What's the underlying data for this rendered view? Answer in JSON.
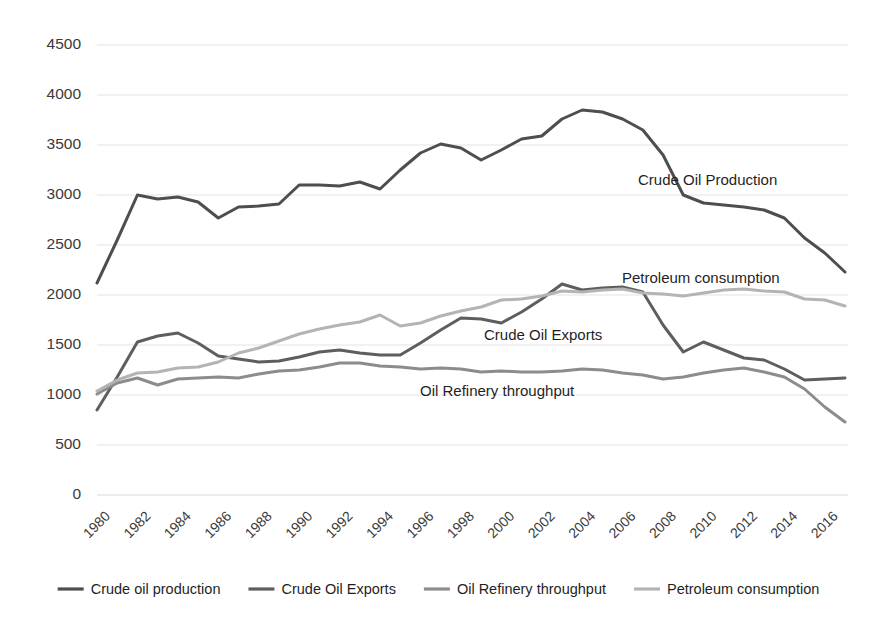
{
  "chart_data": {
    "type": "line",
    "title": "",
    "xlabel": "",
    "ylabel": "",
    "ylim": [
      0,
      4500
    ],
    "ytick_step": 500,
    "grid": true,
    "legend_position": "bottom",
    "x": [
      1980,
      1981,
      1982,
      1983,
      1984,
      1985,
      1986,
      1987,
      1988,
      1989,
      1990,
      1991,
      1992,
      1993,
      1994,
      1995,
      1996,
      1997,
      1998,
      1999,
      2000,
      2001,
      2002,
      2003,
      2004,
      2005,
      2006,
      2007,
      2008,
      2009,
      2010,
      2011,
      2012,
      2013,
      2014,
      2015,
      2016,
      2017
    ],
    "xtick_labels": [
      "1980",
      "1982",
      "1984",
      "1986",
      "1988",
      "1990",
      "1992",
      "1994",
      "1996",
      "1998",
      "2000",
      "2002",
      "2004",
      "2006",
      "2008",
      "2010",
      "2012",
      "2014",
      "2016"
    ],
    "ytick_labels": [
      "0",
      "500",
      "1000",
      "1500",
      "2000",
      "2500",
      "3000",
      "3500",
      "4000",
      "4500"
    ],
    "series": [
      {
        "name": "Crude oil production",
        "color": "#4e4e4e",
        "width": 3.0,
        "annotation": "Crude Oil Production",
        "values": [
          2120,
          2550,
          3000,
          2960,
          2980,
          2930,
          2770,
          2880,
          2890,
          2910,
          3100,
          3100,
          3090,
          3130,
          3060,
          3250,
          3420,
          3510,
          3470,
          3350,
          3450,
          3560,
          3590,
          3760,
          3850,
          3830,
          3760,
          3650,
          3400,
          3000,
          2920,
          2900,
          2880,
          2850,
          2770,
          2570,
          2420,
          2230
        ]
      },
      {
        "name": "Crude Oil Exports",
        "color": "#5e5e5e",
        "width": 3.0,
        "annotation": "Crude Oil Exports",
        "values": [
          850,
          1180,
          1530,
          1590,
          1620,
          1520,
          1390,
          1360,
          1330,
          1340,
          1380,
          1430,
          1450,
          1420,
          1400,
          1400,
          1520,
          1650,
          1770,
          1760,
          1720,
          1830,
          1960,
          2110,
          2050,
          2070,
          2080,
          2030,
          1700,
          1430,
          1530,
          1450,
          1370,
          1350,
          1260,
          1150,
          1160,
          1170
        ]
      },
      {
        "name": "Oil Refinery throughput",
        "color": "#8c8c8c",
        "width": 3.0,
        "annotation": "Oil Refinery throughput",
        "values": [
          1010,
          1120,
          1170,
          1100,
          1160,
          1170,
          1180,
          1170,
          1210,
          1240,
          1250,
          1280,
          1320,
          1320,
          1290,
          1280,
          1260,
          1270,
          1260,
          1230,
          1240,
          1230,
          1230,
          1240,
          1260,
          1250,
          1220,
          1200,
          1160,
          1180,
          1220,
          1250,
          1270,
          1230,
          1180,
          1060,
          880,
          730
        ]
      },
      {
        "name": "Petroleum consumption",
        "color": "#b4b4b4",
        "width": 3.0,
        "annotation": "Petroleum consumption",
        "values": [
          1040,
          1150,
          1220,
          1230,
          1270,
          1280,
          1330,
          1420,
          1470,
          1540,
          1610,
          1660,
          1700,
          1730,
          1800,
          1690,
          1720,
          1790,
          1840,
          1880,
          1950,
          1960,
          1990,
          2040,
          2030,
          2050,
          2060,
          2020,
          2010,
          1990,
          2020,
          2050,
          2060,
          2040,
          2030,
          1960,
          1950,
          1890
        ]
      }
    ],
    "annotations": [
      {
        "text": "Crude Oil Production",
        "x": 638,
        "y": 185
      },
      {
        "text": "Petroleum consumption",
        "x": 622,
        "y": 283
      },
      {
        "text": "Crude Oil Exports",
        "x": 484,
        "y": 340
      },
      {
        "text": "Oil Refinery throughput",
        "x": 420,
        "y": 396
      }
    ]
  },
  "legend": {
    "items": [
      {
        "label": "Crude oil production",
        "color": "#4e4e4e"
      },
      {
        "label": "Crude Oil Exports",
        "color": "#5e5e5e"
      },
      {
        "label": "Oil Refinery throughput",
        "color": "#8c8c8c"
      },
      {
        "label": "Petroleum consumption",
        "color": "#b4b4b4"
      }
    ]
  }
}
